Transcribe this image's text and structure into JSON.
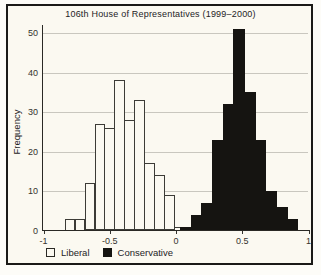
{
  "figure": {
    "title": "106th House of Representatives (1999–2000)",
    "ylabel": "Frequency"
  },
  "legend": {
    "items": [
      {
        "label": "Liberal",
        "swatch": "open-square",
        "color": "#fbf9f1"
      },
      {
        "label": "Conservative",
        "swatch": "filled-square",
        "color": "#151411"
      }
    ]
  },
  "colors": {
    "frame": "#1b1a18",
    "background": "#fbf9f1",
    "gridline": "#c9c7bf",
    "axis": "#2a2925",
    "liberal_fill": "#fbf9f1",
    "liberal_outline": "#3c3b36",
    "conservative_fill": "#151411"
  },
  "chart_data": {
    "type": "bar",
    "subtype": "overlaid-histogram",
    "title": "106th House of Representatives (1999–2000)",
    "xlabel": "",
    "ylabel": "Frequency",
    "xlim": [
      -1,
      1
    ],
    "ylim": [
      0,
      52
    ],
    "x_ticks": [
      -1,
      -0.5,
      0,
      0.5,
      1
    ],
    "x_tick_labels": [
      "-1",
      "-0.5",
      "0",
      "0.5",
      "1"
    ],
    "y_ticks": [
      0,
      10,
      20,
      30,
      40,
      50
    ],
    "grid": "horizontal-only",
    "legend_position": "bottom-left",
    "series": [
      {
        "name": "Liberal",
        "style": "open",
        "bin_start": -0.84,
        "bin_width": 0.075,
        "frequencies": [
          3,
          3,
          12,
          27,
          26,
          38,
          28,
          33,
          17,
          14,
          9,
          1
        ]
      },
      {
        "name": "Conservative",
        "style": "filled",
        "bin_start": 0.03,
        "bin_width": 0.0805,
        "frequencies": [
          1,
          4,
          7,
          23,
          32,
          51,
          35,
          23,
          10,
          6,
          3
        ]
      }
    ]
  }
}
